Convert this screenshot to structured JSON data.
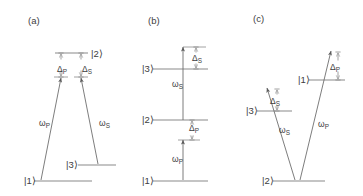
{
  "figure": {
    "type": "energy-level-diagram",
    "background_color": "#ffffff",
    "line_color": "#8a8a8a",
    "arrow_color": "#6e6e6e",
    "text_color": "#3d3d3d",
    "width": 363,
    "height": 196
  },
  "panels": [
    {
      "id": "a",
      "label": "(a)",
      "configuration": "lambda",
      "states": [
        {
          "name": "ket-1",
          "label": "|1⟩",
          "label_x": 24,
          "label_y": 184,
          "line_x1": 34,
          "line_x2": 92,
          "line_y": 181
        },
        {
          "name": "ket-2",
          "label": "|2⟩",
          "label_x": 91,
          "label_y": 57,
          "line_x1": 55,
          "line_x2": 88,
          "line_y": 53
        },
        {
          "name": "ket-3",
          "label": "|3⟩",
          "label_x": 66,
          "label_y": 168,
          "line_x1": 78,
          "line_x2": 116,
          "line_y": 165
        }
      ],
      "transitions": [
        {
          "name": "pump",
          "omega_label": "ω",
          "omega_sub": "P",
          "omega_x": 39,
          "omega_y": 126,
          "x1": 41,
          "y1": 180,
          "x2": 61,
          "y2": 78
        },
        {
          "name": "stokes",
          "omega_label": "ω",
          "omega_sub": "S",
          "omega_x": 99,
          "omega_y": 126,
          "x1": 98,
          "y1": 164,
          "x2": 81,
          "y2": 78
        }
      ],
      "detunings": [
        {
          "name": "delta-pump",
          "label": "Δ",
          "sub": "P",
          "label_x": 57,
          "label_y": 72,
          "x": 61,
          "y_top": 53,
          "y_bottom": 77
        },
        {
          "name": "delta-stokes",
          "label": "Δ",
          "sub": "S",
          "label_x": 82,
          "label_y": 72,
          "x": 81,
          "y_top": 53,
          "y_bottom": 77
        }
      ],
      "virtual_levels": [
        {
          "name": "virtual-pump",
          "x1": 54,
          "x2": 68,
          "y": 77
        },
        {
          "name": "virtual-stokes",
          "x1": 74,
          "x2": 88,
          "y": 77
        }
      ],
      "label_x": 28,
      "label_y": 24
    },
    {
      "id": "b",
      "label": "(b)",
      "configuration": "ladder",
      "states": [
        {
          "name": "ket-1",
          "label": "|1⟩",
          "label_x": 142,
          "label_y": 184,
          "line_x1": 153,
          "line_x2": 208,
          "line_y": 181
        },
        {
          "name": "ket-2",
          "label": "|2⟩",
          "label_x": 142,
          "label_y": 123,
          "line_x1": 153,
          "line_x2": 208,
          "line_y": 120
        },
        {
          "name": "ket-3",
          "label": "|3⟩",
          "label_x": 142,
          "label_y": 72,
          "line_x1": 153,
          "line_x2": 208,
          "line_y": 69
        }
      ],
      "transitions": [
        {
          "name": "pump",
          "omega_label": "ω",
          "omega_sub": "P",
          "omega_x": 172,
          "omega_y": 162,
          "x1": 183,
          "y1": 180,
          "x2": 183,
          "y2": 140
        },
        {
          "name": "stokes",
          "omega_label": "ω",
          "omega_sub": "S",
          "omega_x": 172,
          "omega_y": 87,
          "x1": 183,
          "y1": 120,
          "x2": 183,
          "y2": 47
        }
      ],
      "detunings": [
        {
          "name": "delta-stokes",
          "label": "Δ",
          "sub": "S",
          "label_x": 192,
          "label_y": 61,
          "x": 196,
          "y_top": 47,
          "y_bottom": 69
        },
        {
          "name": "delta-pump",
          "label": "Δ",
          "sub": "P",
          "label_x": 189,
          "label_y": 131,
          "x": 192,
          "y_top": 120,
          "y_bottom": 140
        }
      ],
      "virtual_levels": [
        {
          "name": "virtual-stokes",
          "x1": 183,
          "x2": 206,
          "y": 47
        },
        {
          "name": "virtual-pump",
          "x1": 178,
          "x2": 200,
          "y": 140
        }
      ],
      "label_x": 148,
      "label_y": 24
    },
    {
      "id": "c",
      "label": "(c)",
      "configuration": "vee",
      "states": [
        {
          "name": "ket-2",
          "label": "|2⟩",
          "label_x": 262,
          "label_y": 184,
          "line_x1": 273,
          "line_x2": 325,
          "line_y": 181
        },
        {
          "name": "ket-3",
          "label": "|3⟩",
          "label_x": 246,
          "label_y": 114,
          "line_x1": 257,
          "line_x2": 292,
          "line_y": 111
        },
        {
          "name": "ket-1",
          "label": "|1⟩",
          "label_x": 298,
          "label_y": 83,
          "line_x1": 309,
          "line_x2": 345,
          "line_y": 80
        }
      ],
      "transitions": [
        {
          "name": "stokes",
          "omega_label": "ω",
          "omega_sub": "S",
          "omega_x": 279,
          "omega_y": 133,
          "x1": 295,
          "y1": 180,
          "x2": 267,
          "y2": 88
        },
        {
          "name": "pump",
          "omega_label": "ω",
          "omega_sub": "P",
          "omega_x": 318,
          "omega_y": 127,
          "x1": 300,
          "y1": 180,
          "x2": 331,
          "y2": 51
        }
      ],
      "detunings": [
        {
          "name": "delta-stokes",
          "label": "Δ",
          "sub": "S",
          "label_x": 270,
          "label_y": 104,
          "x": 277,
          "y_top": 89,
          "y_bottom": 111
        },
        {
          "name": "delta-pump",
          "label": "Δ",
          "sub": "P",
          "label_x": 330,
          "label_y": 70,
          "x": 338,
          "y_top": 52,
          "y_bottom": 80
        }
      ],
      "virtual_levels": [],
      "label_x": 253,
      "label_y": 22
    }
  ]
}
